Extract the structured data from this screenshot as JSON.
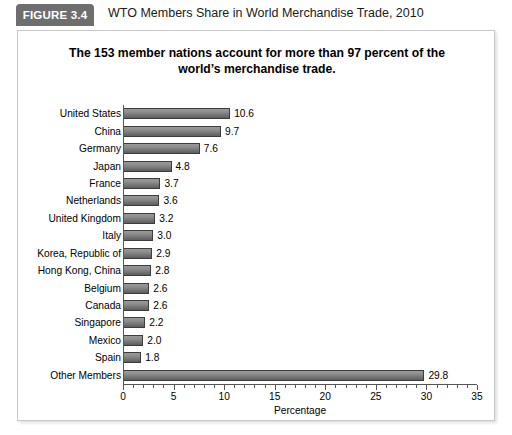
{
  "figure": {
    "badge_label": "FIGURE 3.4",
    "title": "WTO Members Share in World Merchandise Trade, 2010"
  },
  "chart_data": {
    "type": "bar",
    "orientation": "horizontal",
    "title": "The 153 member nations account for more than 97 percent of the world’s merchandise trade.",
    "xlabel": "Percentage",
    "ylabel": "",
    "xlim": [
      0,
      35
    ],
    "xticks": [
      0,
      5,
      10,
      15,
      20,
      25,
      30,
      35
    ],
    "xtick_labels": [
      "0",
      "5",
      "10",
      "15",
      "20",
      "25",
      "30",
      "35"
    ],
    "minor_tick_step": 1,
    "grid": false,
    "legend": false,
    "bar_color": "#7f7f7f",
    "bar_edge_color": "#3c3c3c",
    "categories": [
      "United States",
      "China",
      "Germany",
      "Japan",
      "France",
      "Netherlands",
      "United Kingdom",
      "Italy",
      "Korea, Republic of",
      "Hong Kong, China",
      "Belgium",
      "Canada",
      "Singapore",
      "Mexico",
      "Spain",
      "Other Members"
    ],
    "values": [
      10.6,
      9.7,
      7.6,
      4.8,
      3.7,
      3.6,
      3.2,
      3.0,
      2.9,
      2.8,
      2.6,
      2.6,
      2.2,
      2.0,
      1.8,
      29.8
    ],
    "value_labels": [
      "10.6",
      "9.7",
      "7.6",
      "4.8",
      "3.7",
      "3.6",
      "3.2",
      "3.0",
      "2.9",
      "2.8",
      "2.6",
      "2.6",
      "2.2",
      "2.0",
      "1.8",
      "29.8"
    ]
  }
}
